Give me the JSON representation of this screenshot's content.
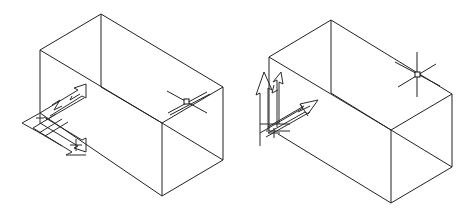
{
  "figures": [
    {
      "id": "left",
      "description": "Isometric wireframe box with UCS icon lying in the bottom-left plane",
      "box_edges": [
        [
          101,
          14,
          40,
          50
        ],
        [
          101,
          14,
          223,
          87
        ],
        [
          40,
          50,
          162,
          123
        ],
        [
          223,
          87,
          162,
          123
        ],
        [
          40,
          50,
          40,
          113
        ],
        [
          101,
          14,
          101,
          87
        ],
        [
          162,
          123,
          162,
          196
        ],
        [
          223,
          87,
          223,
          160
        ],
        [
          40,
          113,
          162,
          196
        ],
        [
          162,
          196,
          223,
          160
        ],
        [
          101,
          87,
          162,
          123
        ],
        [
          162,
          123,
          223,
          160
        ]
      ],
      "cursor": {
        "x": 187,
        "y": 102,
        "style": "crosshair-with-pickbox"
      },
      "ucs_icon": {
        "origin": [
          40,
          120
        ],
        "orientation": "horizontal-plane"
      }
    },
    {
      "id": "right",
      "description": "Isometric wireframe box with UCS icon standing on the left vertical face",
      "box_edges": [
        [
          331,
          20,
          269,
          57
        ],
        [
          331,
          20,
          452,
          94
        ],
        [
          269,
          57,
          391,
          130
        ],
        [
          452,
          94,
          391,
          130
        ],
        [
          269,
          57,
          269,
          131
        ],
        [
          331,
          20,
          331,
          93
        ],
        [
          391,
          130,
          391,
          203
        ],
        [
          452,
          94,
          452,
          167
        ],
        [
          278,
          134,
          391,
          203
        ],
        [
          391,
          203,
          452,
          167
        ],
        [
          331,
          93,
          391,
          130
        ],
        [
          391,
          130,
          452,
          167
        ]
      ],
      "cursor": {
        "x": 417,
        "y": 74,
        "style": "crosshair-with-pickbox"
      },
      "ucs_icon": {
        "origin": [
          277,
          134
        ],
        "orientation": "vertical-plane"
      }
    }
  ],
  "colors": {
    "background": "#ffffff",
    "line": "#222222"
  }
}
